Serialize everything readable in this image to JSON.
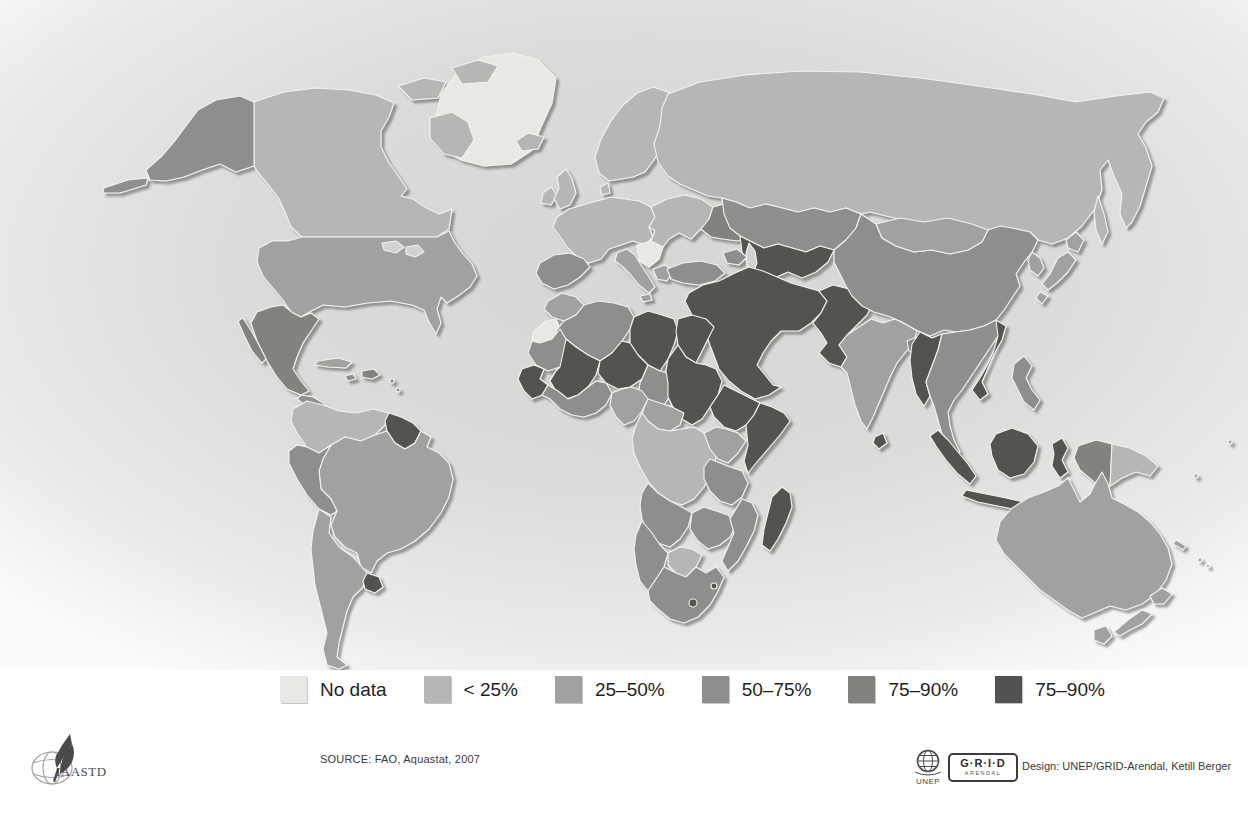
{
  "legend": {
    "colors": {
      "no_data": "#e9e8e4",
      "lt_25": "#b6b6b4",
      "p25_50": "#a1a19f",
      "p50_75": "#8e8e8c",
      "p75_90": "#82827f",
      "p90_plus": "#525250",
      "water": "#d2d2d0"
    },
    "items": [
      {
        "key": "no_data",
        "label": "No data"
      },
      {
        "key": "lt_25",
        "label": "< 25%"
      },
      {
        "key": "p25_50",
        "label": "25–50%"
      },
      {
        "key": "p50_75",
        "label": "50–75%"
      },
      {
        "key": "p75_90",
        "label": "75–90%"
      },
      {
        "key": "p90_plus",
        "label": "75–90%"
      }
    ]
  },
  "footer": {
    "source": "SOURCE: FAO, Aquastat, 2007",
    "design_credit": "Design: UNEP/GRID-Arendal, Ketill Berger",
    "iaastd_label": "IAASTD",
    "unep_label": "UNEP",
    "grid_label": "G·R·I·D",
    "grid_sublabel": "ARENDAL"
  },
  "map": {
    "regions": {
      "greenland": "no_data",
      "arctic-a": "lt_25",
      "arctic-b": "lt_25",
      "arctic-c": "lt_25",
      "baffin": "lt_25",
      "alaska": "p50_75",
      "aleutians": "p50_75",
      "canada": "lt_25",
      "usa": "p25_50",
      "lake-1": "water",
      "lake-2": "water",
      "mexico": "p75_90",
      "baja": "p75_90",
      "central-america": "p50_75",
      "cuba": "p25_50",
      "hispaniola": "p75_90",
      "jamaica": "p50_75",
      "carib-1": "p50_75",
      "carib-2": "p50_75",
      "colombia-venezuela": "lt_25",
      "guyana-suriname": "p90_plus",
      "french-guiana": "no_data",
      "brazil": "p25_50",
      "ecuador-peru": "p50_75",
      "argentina-chile": "p25_50",
      "uruguay": "p90_plus",
      "iceland": "lt_25",
      "ireland": "lt_25",
      "uk": "lt_25",
      "scandinavia": "lt_25",
      "denmark": "lt_25",
      "west-europe": "lt_25",
      "spain-portugal": "p50_75",
      "italy": "p25_50",
      "sicily": "p25_50",
      "ex-yugoslavia": "no_data",
      "greece": "p25_50",
      "east-europe": "lt_25",
      "ukraine": "p75_90",
      "russia": "lt_25",
      "sakhalin": "lt_25",
      "kazakhstan": "p50_75",
      "central-asia": "p90_plus",
      "caspian": "water",
      "caucasus": "p50_75",
      "turkey": "p50_75",
      "middle-east": "p90_plus",
      "afghanistan-pakistan": "p90_plus",
      "india": "p25_50",
      "sri-lanka": "p90_plus",
      "bangladesh": "p75_90",
      "china": "p50_75",
      "mongolia": "p25_50",
      "korea": "p25_50",
      "hokkaido": "p25_50",
      "honshu": "p25_50",
      "kyushu": "p25_50",
      "myanmar": "p90_plus",
      "indochina": "p50_75",
      "vietnam": "p90_plus",
      "sumatra": "p90_plus",
      "java": "p90_plus",
      "borneo": "p90_plus",
      "sulawesi": "p90_plus",
      "philippines": "p50_75",
      "png-west": "p75_90",
      "png-east": "lt_25",
      "timor": "p90_plus",
      "australia": "p25_50",
      "tasmania": "p25_50",
      "nz-north": "p25_50",
      "nz-south": "p25_50",
      "new-caledonia": "p25_50",
      "fiji-1": "p25_50",
      "fiji-2": "p25_50",
      "pacific-1": "p25_50",
      "pacific-2": "p25_50",
      "morocco": "p25_50",
      "western-sahara": "no_data",
      "algeria": "p50_75",
      "libya": "p90_plus",
      "egypt": "p90_plus",
      "mauritania": "p50_75",
      "mali": "p90_plus",
      "niger": "p90_plus",
      "chad": "p50_75",
      "sudan": "p90_plus",
      "ethiopia": "p90_plus",
      "somalia": "p90_plus",
      "senegal-guinea": "p90_plus",
      "west-africa": "p50_75",
      "nigeria": "p25_50",
      "cameroon-car": "p25_50",
      "congo-basin": "lt_25",
      "kenya-uganda": "p25_50",
      "tanzania": "p50_75",
      "angola": "p50_75",
      "zambia-zimbabwe": "p50_75",
      "mozambique": "p50_75",
      "namibia": "p50_75",
      "botswana": "lt_25",
      "south-africa": "p50_75",
      "lesotho": "p90_plus",
      "swaziland": "p90_plus",
      "madagascar": "p90_plus"
    }
  }
}
